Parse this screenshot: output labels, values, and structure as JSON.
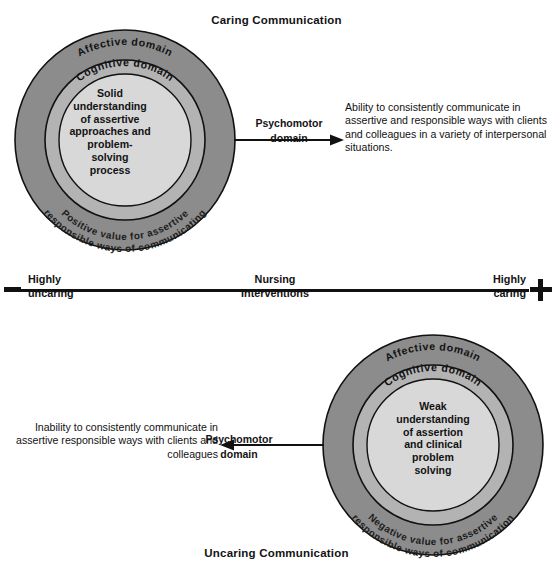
{
  "figure": {
    "type": "conceptual-diagram",
    "caring_title": "Caring Communication",
    "uncaring_title": "Uncaring Communication"
  },
  "colors": {
    "outer_ring": "#8c8c8c",
    "mid_ring": "#b3b3b3",
    "core": "#d8d8d8",
    "stroke": "#111111",
    "text": "#131313",
    "background": "#ffffff"
  },
  "caring": {
    "title": "Caring Communication",
    "outer_ring_label": "Affective domain",
    "mid_ring_label": "Cognitive domain",
    "outer_arc_line1": "Positive value for assertive",
    "outer_arc_line2": "responsible ways of communicating",
    "core_text": "Solid understanding of assertive approaches and problem- solving process",
    "core_lines": [
      "Solid",
      "understanding",
      "of assertive",
      "approaches and",
      "problem-",
      "solving",
      "process"
    ],
    "connector_label_line1": "Psychomotor",
    "connector_label_line2": "domain",
    "outcome_text": "Ability to consistently communicate in assertive and responsible ways with clients and colleagues in a variety of interpersonal situations.",
    "arrow_direction": "right"
  },
  "uncaring": {
    "title": "Uncaring Communication",
    "outer_ring_label": "Affective domain",
    "mid_ring_label": "Cognitive domain",
    "outer_arc_line1": "Negative value for assertive",
    "outer_arc_line2": "responsible ways of communication",
    "core_text": "Weak understanding of assertion and clinical problem solving",
    "core_lines": [
      "Weak",
      "understanding",
      "of assertion",
      "and clinical",
      "problem",
      "solving"
    ],
    "connector_label_line1": "Psychomotor",
    "connector_label_line2": "domain",
    "outcome_text": "Inability to consistently communicate in assertive responsible ways with clients and colleagues",
    "arrow_direction": "left"
  },
  "continuum": {
    "left_sign": "−",
    "right_sign": "+",
    "left_label_top": "Highly",
    "left_label_bottom": "uncaring",
    "center_label_top": "Nursing",
    "center_label_bottom": "Interventions",
    "right_label_top": "Highly",
    "right_label_bottom": "caring"
  }
}
